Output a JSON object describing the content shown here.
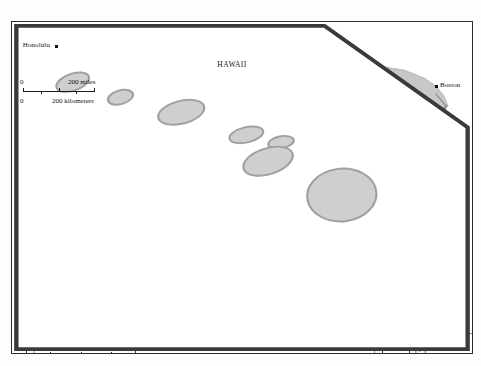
{
  "map": {
    "title": "United States Major Interstate Highways",
    "projection_note": "conterminous united states with alaska and hawaii insets",
    "cities": [
      {
        "name": "Seattle",
        "x": 62,
        "y": 53,
        "anchor": "lab-r"
      },
      {
        "name": "Portland",
        "x": 55,
        "y": 74,
        "anchor": "lab-l"
      },
      {
        "name": "Butte",
        "x": 124,
        "y": 82,
        "anchor": "lab-r"
      },
      {
        "name": "Billings",
        "x": 157,
        "y": 90,
        "anchor": "lab-r"
      },
      {
        "name": "Fargo",
        "x": 237,
        "y": 82,
        "anchor": "lab-l"
      },
      {
        "name": "Minneapolis",
        "x": 264,
        "y": 98,
        "anchor": "lab-l"
      },
      {
        "name": "Sioux Falls",
        "x": 238,
        "y": 113,
        "anchor": "lab-l"
      },
      {
        "name": "Omaha",
        "x": 247,
        "y": 133,
        "anchor": "lab-l"
      },
      {
        "name": "Cheyenne",
        "x": 176,
        "y": 136,
        "anchor": "lab-lt"
      },
      {
        "name": "Salt Lake\nCity",
        "x": 124,
        "y": 140,
        "anchor": "lab-lb"
      },
      {
        "name": "Denver",
        "x": 173,
        "y": 155,
        "anchor": "lab-l"
      },
      {
        "name": "San\nFrancisco",
        "x": 37,
        "y": 155,
        "anchor": "lab-rb"
      },
      {
        "name": "Kansas City",
        "x": 253,
        "y": 156,
        "anchor": "lab-l"
      },
      {
        "name": "St. Louis",
        "x": 282,
        "y": 163,
        "anchor": "lab-lt"
      },
      {
        "name": "Chicago",
        "x": 308,
        "y": 124,
        "anchor": "lab-l"
      },
      {
        "name": "Detroit",
        "x": 345,
        "y": 110,
        "anchor": "lab-l"
      },
      {
        "name": "Columbus",
        "x": 366,
        "y": 134,
        "anchor": "lab-l"
      },
      {
        "name": "Indianapolis",
        "x": 325,
        "y": 145,
        "anchor": "lab-l"
      },
      {
        "name": "Cincinnati",
        "x": 345,
        "y": 146,
        "anchor": "lab-r"
      },
      {
        "name": "Pittsburgh",
        "x": 410,
        "y": 123,
        "anchor": "lab-l"
      },
      {
        "name": "Boston",
        "x": 434,
        "y": 84,
        "anchor": "lab-r"
      },
      {
        "name": "New York",
        "x": 415,
        "y": 110,
        "anchor": "lab-r"
      },
      {
        "name": "Washington, D.C.",
        "x": 397,
        "y": 140,
        "anchor": "lab-r"
      },
      {
        "name": "Louisville",
        "x": 333,
        "y": 160,
        "anchor": "lab-r"
      },
      {
        "name": "Nashville",
        "x": 328,
        "y": 180,
        "anchor": "lab-lt"
      },
      {
        "name": "Charlotte",
        "x": 378,
        "y": 180,
        "anchor": "lab-r"
      },
      {
        "name": "Oklahoma\nCity",
        "x": 238,
        "y": 202,
        "anchor": "lab-lb"
      },
      {
        "name": "Little\nRock",
        "x": 283,
        "y": 202,
        "anchor": "lab-lb"
      },
      {
        "name": "Birmingham",
        "x": 331,
        "y": 208,
        "anchor": "lab-l"
      },
      {
        "name": "Atlanta",
        "x": 355,
        "y": 209,
        "anchor": "lab-r"
      },
      {
        "name": "Charleston",
        "x": 390,
        "y": 208,
        "anchor": "lab-r"
      },
      {
        "name": "Albuquerque",
        "x": 165,
        "y": 208,
        "anchor": "lab-l"
      },
      {
        "name": "Los Angeles",
        "x": 66,
        "y": 208,
        "anchor": "lab-l"
      },
      {
        "name": "San Diego",
        "x": 68,
        "y": 218,
        "anchor": "lab-l"
      },
      {
        "name": "Tucson",
        "x": 124,
        "y": 222,
        "anchor": "lab-l"
      },
      {
        "name": "El Paso",
        "x": 159,
        "y": 229,
        "anchor": "lab-l"
      },
      {
        "name": "Fort Worth",
        "x": 242,
        "y": 228,
        "anchor": "lab-l"
      },
      {
        "name": "Dallas",
        "x": 249,
        "y": 230,
        "anchor": "lab-r"
      },
      {
        "name": "Montgomery",
        "x": 333,
        "y": 222,
        "anchor": "lab-l"
      },
      {
        "name": "Savannah",
        "x": 385,
        "y": 220,
        "anchor": "lab-r"
      },
      {
        "name": "Jacksonville",
        "x": 385,
        "y": 236,
        "anchor": "lab-r"
      },
      {
        "name": "Mobile",
        "x": 325,
        "y": 239,
        "anchor": "lab-l"
      },
      {
        "name": "New Orleans",
        "x": 310,
        "y": 254,
        "anchor": "lab-r"
      },
      {
        "name": "San Antonio",
        "x": 233,
        "y": 262,
        "anchor": "lab-l"
      },
      {
        "name": "Houston",
        "x": 261,
        "y": 261,
        "anchor": "lab-b"
      },
      {
        "name": "Tampa",
        "x": 378,
        "y": 263,
        "anchor": "lab-l"
      },
      {
        "name": "Miami",
        "x": 397,
        "y": 285,
        "anchor": "lab-r"
      }
    ],
    "insets": [
      {
        "id": "alaska",
        "title": "ALASKA",
        "subtitle": "(No interstate\nhighways)",
        "scale": {
          "miles_label": "500 miles",
          "km_label": "500 kilometers",
          "zero_top": "0",
          "zero_bottom": "0"
        }
      },
      {
        "id": "hawaii",
        "title": "HAWAII",
        "city": "Honolulu",
        "scale": {
          "miles_label": "200 miles",
          "km_label": "200 kilometers",
          "zero_top": "0",
          "zero_bottom": "0"
        }
      }
    ],
    "scale_main": {
      "miles_ticks": [
        "0",
        "250",
        "500 miles"
      ],
      "km_ticks": [
        "0",
        "250",
        "500 kilometers"
      ]
    },
    "legend": {
      "label": "Major interstate\nhighways",
      "swatch": "double-line-road-symbol"
    },
    "colors": {
      "land": "#c9c9c9",
      "water": "#ffffff",
      "border": "#2c2c2c",
      "road": "#8e8e8e",
      "marker": "#111111",
      "text": "#141414",
      "legend_border": "#8a8a8a"
    }
  }
}
